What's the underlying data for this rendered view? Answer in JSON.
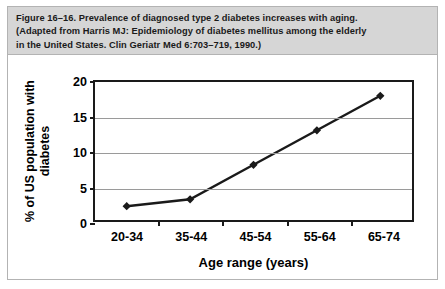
{
  "figure": {
    "caption_lines": [
      "Figure 16–16. Prevalence of diagnosed type 2 diabetes increases with aging.",
      "(Adapted from Harris MJ: Epidemiology of diabetes mellitus among the elderly",
      "in the United States. Clin Geriatr Med 6:703–719, 1990.)"
    ]
  },
  "chart_data": {
    "type": "line",
    "title": "",
    "categories": [
      "20-34",
      "35-44",
      "45-54",
      "55-64",
      "65-74"
    ],
    "values": [
      2,
      3,
      8,
      13,
      18
    ],
    "series": [
      {
        "name": "% of US population with diabetes",
        "values": [
          2,
          3,
          8,
          13,
          18
        ]
      }
    ],
    "xlabel": "Age range (years)",
    "ylabel": "% of US population with\ndiabetes",
    "ylabel_line1": "% of US population with",
    "ylabel_line2": "diabetes",
    "yticks": [
      0,
      5,
      10,
      15,
      20
    ],
    "ytick_labels": [
      "0",
      "5",
      "10",
      "15",
      "20"
    ],
    "ylim": [
      0,
      20
    ],
    "grid": true,
    "grid_axis": "y",
    "legend": false,
    "marker": "diamond",
    "line_color": "#1a1a1a",
    "marker_color": "#1a1a1a",
    "grid_color": "#9a9a9a",
    "axis_color": "#1a1a1a",
    "caption_background": "#d6d6d6",
    "plot_background": "#ffffff"
  }
}
